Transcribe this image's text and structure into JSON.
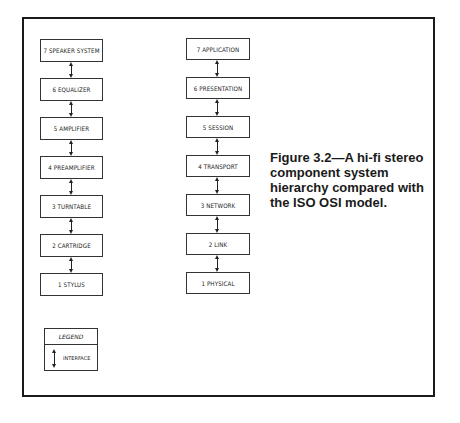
{
  "figure": {
    "caption_lines": [
      "Figure 3.2—A hi-fi stereo",
      "component system",
      "hierarchy compared with",
      "the ISO OSI model."
    ]
  },
  "hifi_stack": {
    "layers": [
      "7 SPEAKER SYSTEM",
      "6 EQUALIZER",
      "5 AMPLIFIER",
      "4 PREAMPLIFIER",
      "3 TURNTABLE",
      "2 CARTRIDGE",
      "1 STYLUS"
    ]
  },
  "osi_stack": {
    "layers": [
      "7 APPLICATION",
      "6 PRESENTATION",
      "5 SESSION",
      "4 TRANSPORT",
      "3 NETWORK",
      "2 LINK",
      "1 PHYSICAL"
    ]
  },
  "legend": {
    "title": "LEGEND",
    "items": [
      {
        "icon": "double-arrow-icon",
        "label": "INTERFACE"
      }
    ]
  }
}
